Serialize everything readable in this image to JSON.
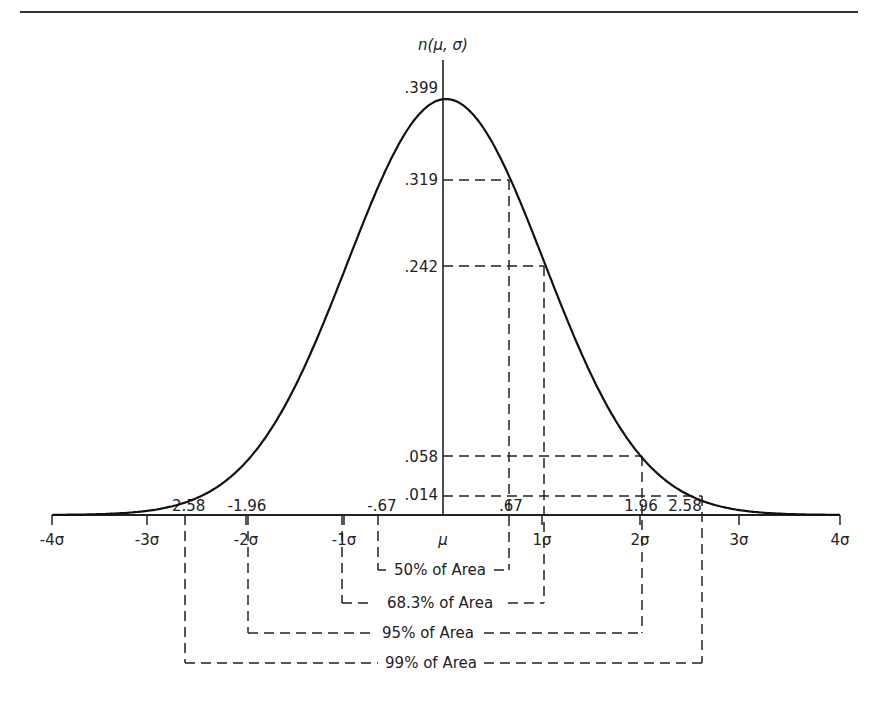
{
  "chart_data": {
    "type": "line",
    "title": "",
    "ylabel": "n(μ, σ)",
    "xlabel": "",
    "x_range": [
      -4,
      4
    ],
    "y_range": [
      0,
      0.399
    ],
    "grid": false,
    "series": [
      {
        "name": "Standard normal density",
        "function": "n(x) = (1/√(2π)) e^(-x²/2)",
        "x": [
          -4,
          -3,
          -2.58,
          -2,
          -1.96,
          -1,
          -0.67,
          0,
          0.67,
          1,
          1.96,
          2,
          2.58,
          3,
          4
        ],
        "y": [
          0.0001,
          0.004,
          0.014,
          0.054,
          0.058,
          0.242,
          0.319,
          0.399,
          0.319,
          0.242,
          0.058,
          0.054,
          0.014,
          0.004,
          0.0001
        ]
      }
    ],
    "x_tick_labels": [
      "-4σ",
      "-3σ",
      "-2σ",
      "-1σ",
      "μ",
      "1σ",
      "2σ",
      "3σ",
      "4σ"
    ],
    "x_tick_values": [
      -4,
      -3,
      -2,
      -1,
      0,
      1,
      2,
      3,
      4
    ],
    "x_marker_labels": [
      "-2.58",
      "-1.96",
      "-.67",
      ".67",
      "1.96",
      "2.58"
    ],
    "x_marker_values": [
      -2.58,
      -1.96,
      -0.67,
      0.67,
      1.96,
      2.58
    ],
    "y_tick_labels": [
      ".399",
      ".319",
      ".242",
      ".058",
      ".014"
    ],
    "y_tick_values": [
      0.399,
      0.319,
      0.242,
      0.058,
      0.014
    ],
    "annotations": [
      {
        "label": "50% of Area",
        "from": -0.67,
        "to": 0.67
      },
      {
        "label": "68.3% of Area",
        "from": -1,
        "to": 1
      },
      {
        "label": "95% of Area",
        "from": -1.96,
        "to": 1.96
      },
      {
        "label": "99% of Area",
        "from": -2.58,
        "to": 2.58
      }
    ]
  },
  "labels": {
    "y_axis": "n(μ, σ)",
    "mu": "μ",
    "y_ticks": [
      ".399",
      ".319",
      ".242",
      ".058",
      ".014"
    ],
    "x_ticks": [
      "-4σ",
      "-3σ",
      "-2σ",
      "-1σ",
      "1σ",
      "2σ",
      "3σ",
      "4σ"
    ],
    "x_markers": [
      "-2.58",
      "-1.96",
      "-.67",
      ".67",
      "1.96",
      "2.58"
    ],
    "areas": [
      "50% of Area",
      "68.3% of Area",
      "95% of Area",
      "99% of Area"
    ]
  }
}
